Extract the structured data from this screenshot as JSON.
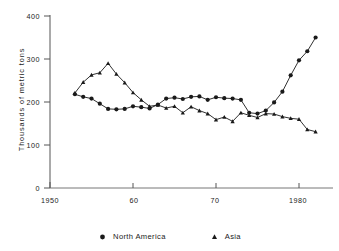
{
  "chart_data": {
    "type": "line",
    "title": "",
    "subtitle": "",
    "xlabel": "",
    "ylabel": "Thousands of metric tons",
    "xlim": [
      1950,
      1984
    ],
    "ylim": [
      0,
      400
    ],
    "grid": false,
    "legend_position": "bottom",
    "y_ticks": [
      0,
      100,
      200,
      300,
      400
    ],
    "y_tick_labels": [
      "0",
      "100",
      "200",
      "300",
      "400"
    ],
    "x_ticks": [
      1950,
      1960,
      1970,
      1980
    ],
    "x_tick_labels": [
      "1950",
      "60",
      "70",
      "1980"
    ],
    "series": [
      {
        "name": "North America",
        "marker": "circle",
        "color": "#1a1a1a",
        "x": [
          1953,
          1954,
          1955,
          1956,
          1957,
          1958,
          1959,
          1960,
          1961,
          1962,
          1963,
          1964,
          1965,
          1966,
          1967,
          1968,
          1969,
          1970,
          1971,
          1972,
          1973,
          1974,
          1975,
          1976,
          1977,
          1978,
          1979,
          1980,
          1981,
          1982
        ],
        "values": [
          218,
          212,
          208,
          196,
          184,
          183,
          184,
          190,
          188,
          185,
          194,
          208,
          210,
          207,
          212,
          213,
          205,
          211,
          209,
          208,
          205,
          175,
          173,
          180,
          199,
          224,
          262,
          297,
          318,
          350
        ]
      },
      {
        "name": "Asia",
        "marker": "triangle",
        "color": "#1a1a1a",
        "x": [
          1953,
          1954,
          1955,
          1956,
          1957,
          1958,
          1959,
          1960,
          1961,
          1962,
          1963,
          1964,
          1965,
          1966,
          1967,
          1968,
          1969,
          1970,
          1971,
          1972,
          1973,
          1974,
          1975,
          1976,
          1977,
          1978,
          1979,
          1980,
          1981,
          1982
        ],
        "values": [
          221,
          246,
          263,
          268,
          290,
          265,
          245,
          222,
          205,
          190,
          193,
          186,
          190,
          175,
          189,
          180,
          173,
          159,
          165,
          155,
          175,
          169,
          164,
          173,
          172,
          166,
          162,
          160,
          136,
          131
        ]
      }
    ]
  },
  "legend": {
    "entries": [
      {
        "label": "North America",
        "marker": "circle-marker"
      },
      {
        "label": "Asia",
        "marker": "triangle-marker"
      }
    ]
  }
}
